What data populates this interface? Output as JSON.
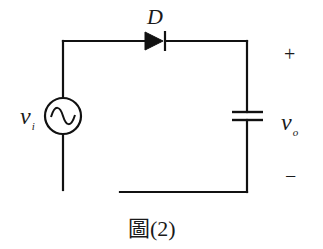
{
  "diagram": {
    "type": "circuit-schematic",
    "components": [
      {
        "id": "source",
        "kind": "ac-voltage-source",
        "label": "v",
        "subscript": "i"
      },
      {
        "id": "diode",
        "kind": "diode",
        "label": "D",
        "orientation": "anode-left, cathode-right"
      },
      {
        "id": "capacitor",
        "kind": "capacitor",
        "label": "v",
        "subscript": "o"
      }
    ],
    "output_polarity": {
      "plus": "+",
      "minus": "−"
    },
    "caption": "圖(2)",
    "colors": {
      "wire": "#111111",
      "background": "#ffffff"
    }
  }
}
